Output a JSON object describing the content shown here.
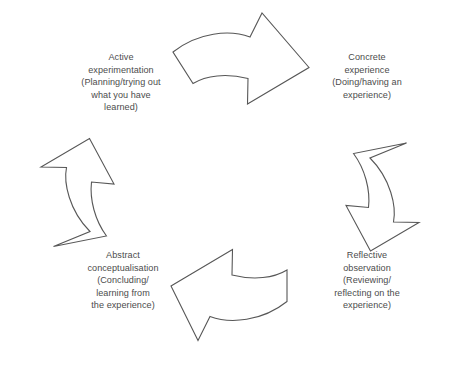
{
  "diagram": {
    "background_color": "#ffffff",
    "stroke_color": "#575757",
    "text_color": "#4c4c4c",
    "stages": [
      {
        "id": "concrete-experience",
        "heading": "Concrete experience",
        "detail": "(Doing/having an experience)",
        "text": "Concrete\nexperience\n(Doing/having an\nexperience)",
        "position": "top-right"
      },
      {
        "id": "reflective-observation",
        "heading": "Reflective observation",
        "detail": "(Reviewing/reflecting on the experience)",
        "text": "Reflective\nobservation\n(Reviewing/\nreflecting on the\nexperience)",
        "position": "bottom-right"
      },
      {
        "id": "abstract-conceptualisation",
        "heading": "Abstract conceptualisation",
        "detail": "(Concluding/learning from the experience)",
        "text": "Abstract\nconceptualisation\n(Concluding/\nlearning from\nthe experience)",
        "position": "bottom-left"
      },
      {
        "id": "active-experimentation",
        "heading": "Active experimentation",
        "detail": "(Planning/trying out what you have learned)",
        "text": "Active\nexperimentation\n(Planning/trying out\nwhat you have\nlearned)",
        "position": "top-left"
      }
    ],
    "arrows": [
      {
        "id": "arrow-top",
        "name": "arrow-pointing-right",
        "direction": "right"
      },
      {
        "id": "arrow-right",
        "name": "arrow-pointing-down",
        "direction": "down"
      },
      {
        "id": "arrow-bottom",
        "name": "arrow-pointing-left",
        "direction": "left"
      },
      {
        "id": "arrow-left",
        "name": "arrow-pointing-up",
        "direction": "up"
      }
    ]
  }
}
